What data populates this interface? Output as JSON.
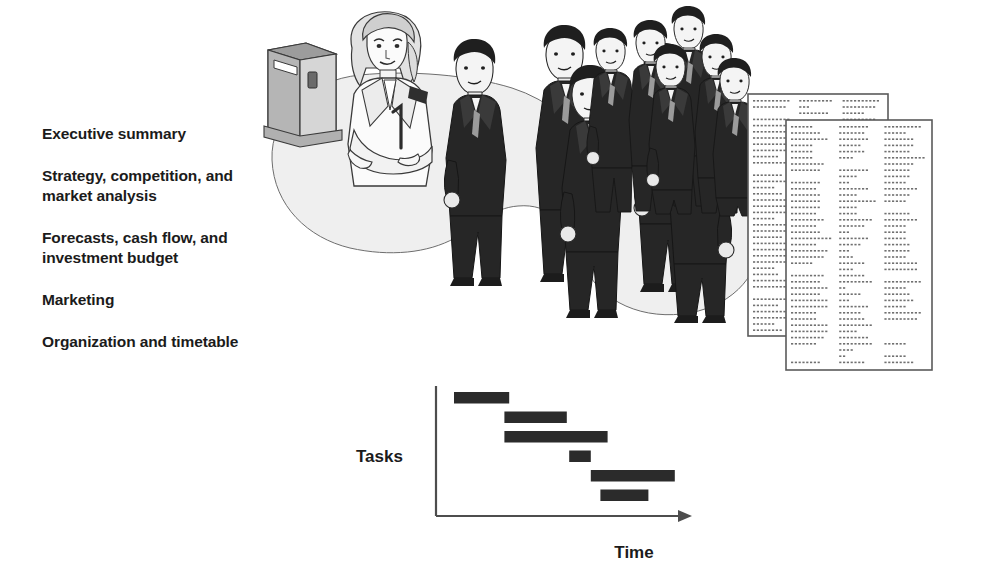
{
  "agenda": {
    "items": [
      {
        "label": "Executive summary"
      },
      {
        "label": "Strategy, competition, and\nmarket analysis"
      },
      {
        "label": "Forecasts, cash flow, and\ninvestment budget"
      },
      {
        "label": "Marketing"
      },
      {
        "label": "Organization and timetable"
      }
    ]
  },
  "illustration": {
    "scene_name": "business-presentation-scene",
    "presenter": "woman-presenter",
    "podium": "lectern",
    "group_one_count": 5,
    "group_two_count": 6,
    "stage_color": "#efefef",
    "suit_color": "#262626"
  },
  "documents": {
    "back_page_name": "report-page-back",
    "front_page_name": "report-page-front",
    "page_color": "#ffffff",
    "border_color": "#5a5a5a",
    "text_dot_color": "#707070"
  },
  "chart_data": {
    "type": "bar",
    "title": "",
    "xlabel": "Time",
    "ylabel": "Tasks",
    "orientation": "horizontal",
    "grid": false,
    "legend": null,
    "bar_color": "#2b2b2b",
    "axis_color": "#4d4d4d",
    "xlim": [
      0,
      100
    ],
    "categories": [
      "Task 1",
      "Task 2",
      "Task 3",
      "Task 4",
      "Task 5",
      "Task 6"
    ],
    "bars": [
      {
        "name": "Task 1",
        "start": 5,
        "end": 28
      },
      {
        "name": "Task 2",
        "start": 26,
        "end": 52
      },
      {
        "name": "Task 3",
        "start": 26,
        "end": 69
      },
      {
        "name": "Task 4",
        "start": 53,
        "end": 62
      },
      {
        "name": "Task 5",
        "start": 62,
        "end": 97
      },
      {
        "name": "Task 6",
        "start": 66,
        "end": 86
      }
    ]
  }
}
